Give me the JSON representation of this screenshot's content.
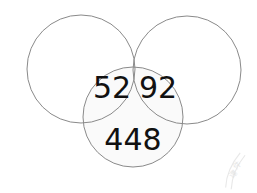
{
  "figure": {
    "type": "venn-diagram",
    "background_color": "#ffffff",
    "stroke_color": "#8a8a8a",
    "text_color": "#111111",
    "highlight_fill": "#fafafa",
    "plain_fill": "#ffffff",
    "width": 257,
    "height": 193
  },
  "circles": {
    "top_left": {
      "name": "top-left-circle",
      "cx": 81,
      "cy": 69,
      "r": 54,
      "fill": "#ffffff"
    },
    "top_right": {
      "name": "top-right-circle",
      "cx": 187,
      "cy": 70,
      "r": 54,
      "fill": "#ffffff"
    },
    "bottom": {
      "name": "bottom-circle",
      "cx": 133,
      "cy": 117,
      "r": 50,
      "fill": "#fafafa"
    }
  },
  "labels": {
    "left_overlap": {
      "text": "52",
      "x": 112,
      "y": 89,
      "font_size": 30
    },
    "right_overlap": {
      "text": "92",
      "x": 158,
      "y": 89,
      "font_size": 30
    },
    "bottom_only": {
      "text": "448",
      "x": 133,
      "y": 141,
      "font_size": 30
    }
  },
  "watermark": {
    "label": "faint rotated cjk watermark",
    "glyphs": "课件",
    "rotation_deg": -42,
    "opacity": 0.3,
    "color": "#b4b4b4"
  },
  "chart_data": {
    "type": "venn",
    "title": "",
    "sets": [
      "Top Left",
      "Top Right",
      "Bottom"
    ],
    "regions": [
      {
        "name": "top-left-only",
        "sets": [
          "Top Left"
        ],
        "label": "",
        "value": null
      },
      {
        "name": "top-right-only",
        "sets": [
          "Top Right"
        ],
        "label": "",
        "value": null
      },
      {
        "name": "bottom-and-top-left",
        "sets": [
          "Bottom",
          "Top Left"
        ],
        "label": "52",
        "value": 52
      },
      {
        "name": "bottom-and-top-right",
        "sets": [
          "Bottom",
          "Top Right"
        ],
        "label": "92",
        "value": 92
      },
      {
        "name": "bottom-only",
        "sets": [
          "Bottom"
        ],
        "label": "448",
        "value": 448
      }
    ],
    "values": [
      52,
      92,
      448
    ],
    "categories": [
      "52",
      "92",
      "448"
    ],
    "legend": [],
    "annotations": [],
    "grid": false
  }
}
